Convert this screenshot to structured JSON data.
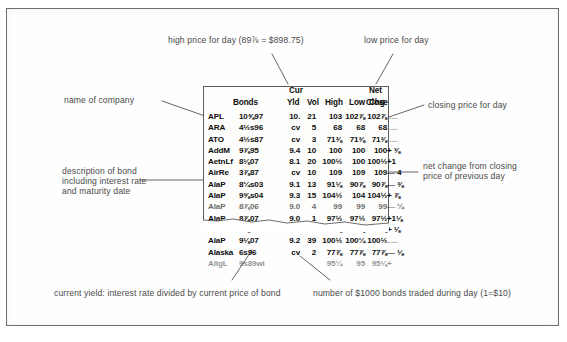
{
  "figure": {
    "source_type": "newspaper-clipping"
  },
  "table": {
    "headers": {
      "cur": "Cur",
      "net": "Net",
      "bonds": "Bonds",
      "yld": "Yld",
      "vol": "Vol",
      "high": "High",
      "low": "Low",
      "close": "Close",
      "chg": "Chg"
    },
    "rows": [
      {
        "company": "APL",
        "bond": "10⅝97",
        "yld": "10.",
        "vol": "21",
        "high": "103",
        "low": "102⅞",
        "close": "102⅞",
        "chg": "....."
      },
      {
        "company": "ARA",
        "bond": "4½s96",
        "yld": "cv",
        "vol": "5",
        "high": "68",
        "low": "68",
        "close": "68",
        "chg": "....."
      },
      {
        "company": "ATO",
        "bond": "4½s87",
        "yld": "cv",
        "vol": "3",
        "high": "71⅜",
        "low": "71⅜",
        "close": "71⅜",
        "chg": "....."
      },
      {
        "company": "AddM",
        "bond": "9⅞95",
        "yld": "9.4",
        "vol": "10",
        "high": "100",
        "low": "100",
        "close": "100",
        "chg": "+ ⅜"
      },
      {
        "company": "AetnLf",
        "bond": "8⅛07",
        "yld": "8.1",
        "vol": "20",
        "high": "100½",
        "low": "100",
        "close": "100½",
        "chg": "+1"
      },
      {
        "company": "AirRe",
        "bond": "3⅞87",
        "yld": "cv",
        "vol": "10",
        "high": "109",
        "low": "109",
        "close": "109",
        "chg": "— 4"
      },
      {
        "company": "AlaP",
        "bond": "8¼s03",
        "yld": "9.1",
        "vol": "13",
        "high": "91⅛",
        "low": "90⅞",
        "close": "90⅞",
        "chg": "— ⅜"
      },
      {
        "company": "AlaP",
        "bond": "9⅝s04",
        "yld": "9.3",
        "vol": "15",
        "high": "104½",
        "low": "104",
        "close": "104½",
        "chg": "+ ⅞"
      },
      {
        "company": "AlaP",
        "bond": "8⅞06",
        "yld": "9.0",
        "vol": "4",
        "high": "99",
        "low": "99",
        "close": "99",
        "chg": "— ¼"
      },
      {
        "company": "AlaP",
        "bond": "8⅞07",
        "yld": "9.0",
        "vol": "1",
        "high": "97½",
        "low": "97½",
        "close": "97½",
        "chg": "+1⅛"
      },
      {
        "company": "AlaP",
        "bond": "8⅜87",
        "yld": "8.8",
        "vol": "23",
        "high": "98⅞",
        "low": "98⅜",
        "close": "98⅞",
        "chg": "+ ⅛"
      },
      {
        "company": "AlaP",
        "bond": "9⅛07",
        "yld": "9.2",
        "vol": "39",
        "high": "100½",
        "low": "100¼",
        "close": "100½",
        "chg": "....."
      },
      {
        "company": "Alaska",
        "bond": "6s96",
        "yld": "cv",
        "vol": "2",
        "high": "77⅞",
        "low": "77⅞",
        "close": "77⅞",
        "chg": "— ⅛"
      },
      {
        "company": "AllgL",
        "bond": "9s89wi",
        "yld": "",
        "vol": "",
        "high": "95¼",
        "low": "95",
        "close": "95⅛",
        "chg": "+"
      }
    ]
  },
  "annotations": {
    "high_price": "high price for day (89⅞ = $898.75)",
    "low_price": "low price for day",
    "company_name": "name of company",
    "closing_price": "closing price for day",
    "bond_description_l1": "description of bond",
    "bond_description_l2": "including interest rate",
    "bond_description_l3": "and maturity date",
    "net_change_l1": "net change from closing",
    "net_change_l2": "price of previous day",
    "current_yield": "current yield: interest rate divided by current price of bond",
    "volume": "number of $1000 bonds traded during day (1=$10)"
  }
}
